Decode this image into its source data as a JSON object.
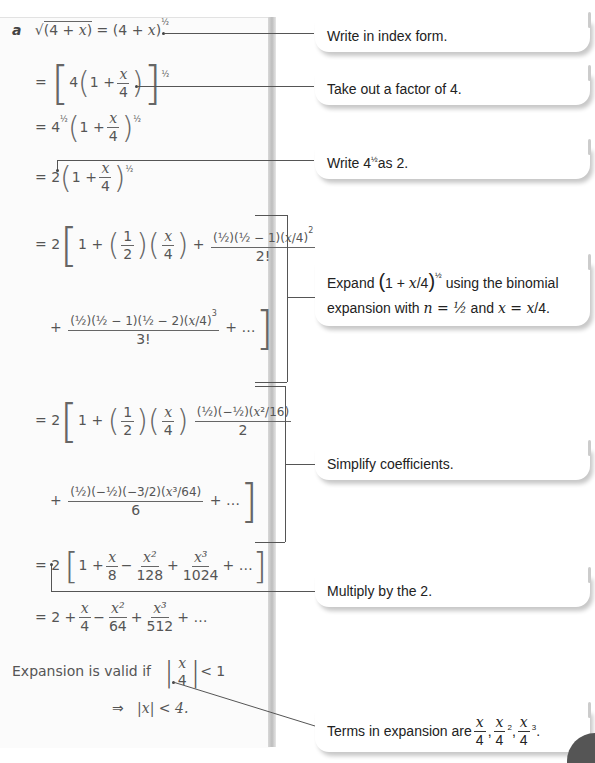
{
  "worked_solution": {
    "part_label": "a",
    "steps": [
      {
        "id": "step1",
        "text": "√(4 + x) = (4 + x)^(1/2)"
      },
      {
        "id": "step2",
        "text": "= [4(1 + x/4)]^(1/2)"
      },
      {
        "id": "step3",
        "text": "= 4^(1/2)(1 + x/4)^(1/2)"
      },
      {
        "id": "step4",
        "text": "= 2(1 + x/4)^(1/2)"
      },
      {
        "id": "step5",
        "text": "= 2[1 + (1/2)(x/4) + (1/2)(1/2 − 1)(x/4)^2 / 2! + (1/2)(1/2 − 1)(1/2 − 2)(x/4)^3 / 3! + …]"
      },
      {
        "id": "step6",
        "text": "= 2[1 + (1/2)(x/4) + (1/2)(−1/2)(x^2/16) / 2 + (1/2)(−1/2)(−3/2)(x^3/64) / 6 + …]"
      },
      {
        "id": "step7",
        "text": "= 2[1 + x/8 − x^2/128 + x^3/1024 + …]"
      },
      {
        "id": "step8",
        "text": "= 2 + x/4 − x^2/64 + x^3/512 + …"
      }
    ],
    "validity": {
      "label": "Expansion is valid if",
      "condition": "|x/4| < 1",
      "implies": "⇒",
      "result": "|x| < 4."
    }
  },
  "symbols": {
    "eq": "=",
    "plus": "+",
    "minus": "−",
    "ellipsis": "…",
    "one": "1",
    "two": "2",
    "three": "3",
    "four": "4",
    "six": "6",
    "eight": "8",
    "x": "x",
    "half_num": "1",
    "half_den": "2",
    "sixteen": "16",
    "sixtyfour": "64",
    "onetwoeight": "128",
    "tentwentyfour": "1024",
    "fivetwelve": "512",
    "fact2": "2!",
    "fact3": "3!",
    "sqrt": "√",
    "lp": "(",
    "rp": ")",
    "lb": "[",
    "rb": "]",
    "sq": "2",
    "cube": "3",
    "sup_half": "½",
    "bar": "|",
    "lt": "<",
    "lt1": "< 1",
    "x2": "x²",
    "x3": "x³"
  },
  "notes": [
    {
      "id": "note-index-form",
      "text": "Write in index form."
    },
    {
      "id": "note-factor",
      "text": "Take out a factor of 4."
    },
    {
      "id": "note-write-2",
      "text_before": "Write 4",
      "sup": "½",
      "text_after": " as 2."
    },
    {
      "id": "note-expand",
      "line1_before": "Expand ",
      "line1_after": " using the binomial",
      "line2_before": "expansion with ",
      "n_eq": "n = ½",
      "and": " and ",
      "x_eq": "x = "
    },
    {
      "id": "note-simplify",
      "text": "Simplify coefficients."
    },
    {
      "id": "note-multiply",
      "text": "Multiply by the 2."
    },
    {
      "id": "note-terms",
      "text": "Terms in expansion are "
    }
  ]
}
